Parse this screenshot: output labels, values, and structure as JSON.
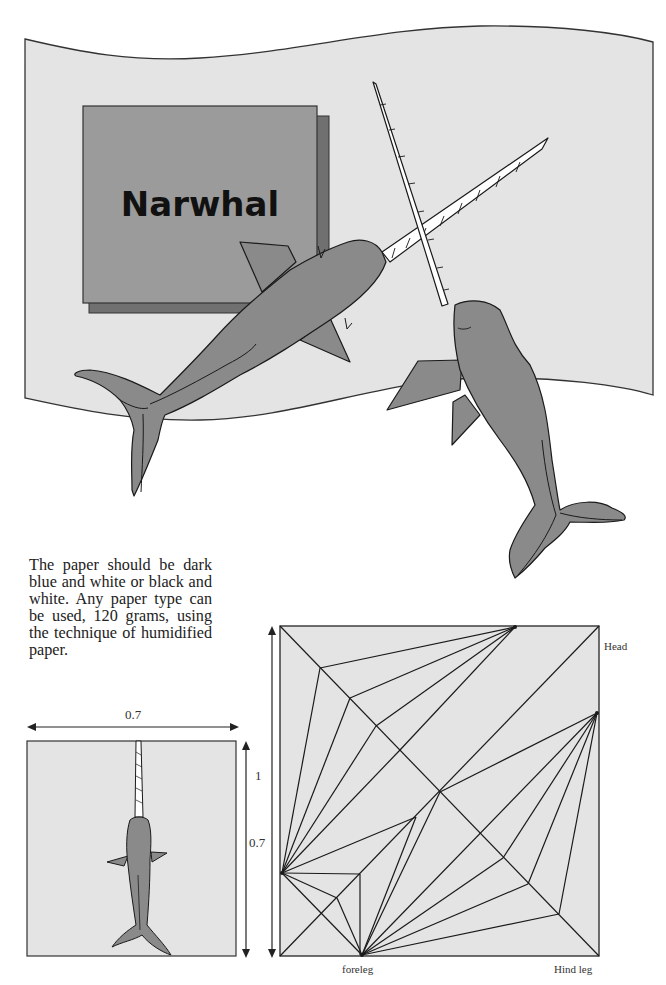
{
  "title": "Narwhal",
  "description": "The paper should be dark blue and white or black and white. Any paper type can be used, 120 grams, using the technique of humidified paper.",
  "model_diagram": {
    "width_label": "0.7",
    "height_label": "0.7",
    "square_label": "1"
  },
  "crease_pattern": {
    "labels": {
      "head": "Head",
      "foreleg": "foreleg",
      "hind_leg": "Hind leg"
    }
  },
  "colors": {
    "paper_bg": "#e4e4e4",
    "title_box": "#9b9b9b",
    "title_shadow": "#707070",
    "narwhal_body": "#8a8a8a",
    "line": "#1a1a1a"
  }
}
